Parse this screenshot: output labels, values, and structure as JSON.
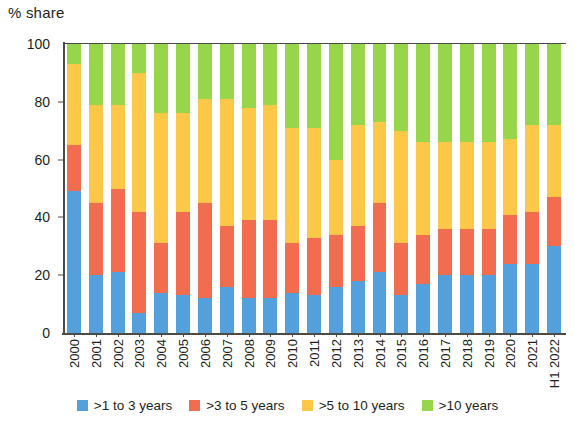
{
  "chart_data": {
    "type": "bar",
    "stacked": true,
    "title": "",
    "ylabel": "% share",
    "xlabel": "",
    "ylim": [
      0,
      100
    ],
    "yticks": [
      0,
      20,
      40,
      60,
      80,
      100
    ],
    "grid": false,
    "legend_position": "bottom",
    "categories": [
      "2000",
      "2001",
      "2002",
      "2003",
      "2004",
      "2005",
      "2006",
      "2007",
      "2008",
      "2009",
      "2010",
      "2011",
      "2012",
      "2013",
      "2014",
      "2015",
      "2016",
      "2017",
      "2018",
      "2019",
      "2020",
      "2021",
      "H1 2022"
    ],
    "series": [
      {
        "name": ">1 to 3 years",
        "color": "#54a0dd",
        "values": [
          49,
          20,
          21,
          7,
          14,
          13,
          12,
          16,
          12,
          12,
          14,
          13,
          16,
          18,
          21,
          13,
          17,
          20,
          20,
          20,
          24,
          24,
          30
        ]
      },
      {
        "name": ">3 to 5 years",
        "color": "#f26c4f",
        "values": [
          16,
          25,
          29,
          35,
          17,
          29,
          33,
          21,
          27,
          27,
          17,
          20,
          18,
          19,
          24,
          18,
          17,
          16,
          16,
          16,
          17,
          18,
          17
        ]
      },
      {
        "name": ">5 to 10 years",
        "color": "#fdc847",
        "values": [
          28,
          34,
          29,
          48,
          45,
          34,
          36,
          44,
          39,
          40,
          40,
          38,
          26,
          35,
          28,
          39,
          32,
          30,
          30,
          30,
          26,
          30,
          25
        ]
      },
      {
        "name": ">10 years",
        "color": "#97d64a",
        "values": [
          7,
          21,
          21,
          10,
          24,
          24,
          19,
          19,
          22,
          21,
          29,
          29,
          40,
          28,
          27,
          30,
          34,
          34,
          34,
          34,
          33,
          28,
          28
        ]
      }
    ]
  },
  "legend": {
    "items": [
      {
        "label": ">1 to 3 years",
        "color": "#54a0dd"
      },
      {
        "label": ">3 to 5 years",
        "color": "#f26c4f"
      },
      {
        "label": ">5 to 10 years",
        "color": "#fdc847"
      },
      {
        "label": ">10 years",
        "color": "#97d64a"
      }
    ]
  },
  "axes": {
    "y_title": "% share",
    "y_tick_labels": [
      "100",
      "80",
      "60",
      "40",
      "20",
      "0"
    ]
  }
}
